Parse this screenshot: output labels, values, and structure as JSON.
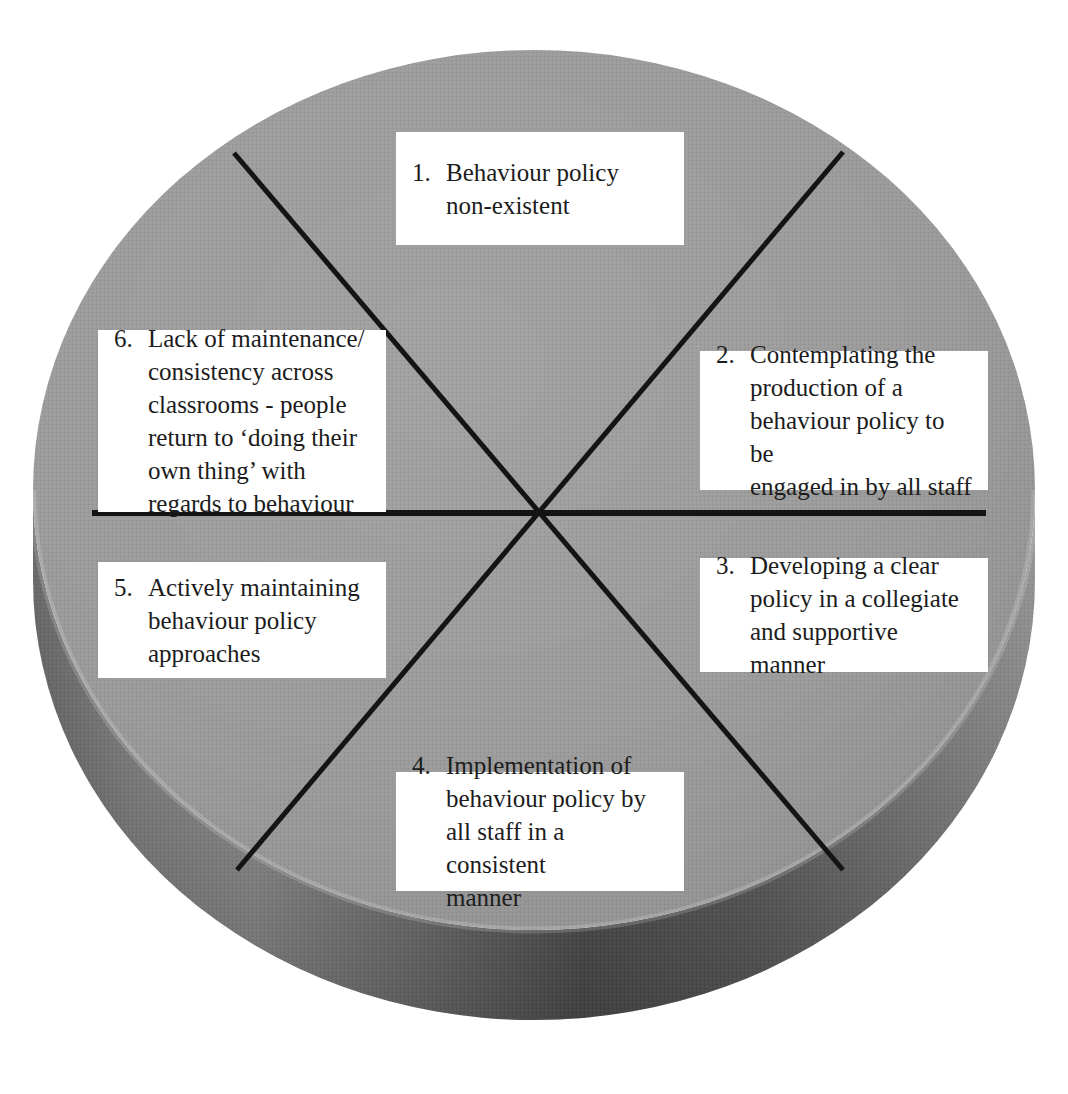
{
  "diagram": {
    "shape": "3d-disc-cylinder",
    "segments": 6,
    "colors": {
      "disc_top": "#9a9a9a",
      "disc_top_highlight": "#a6a6a6",
      "disc_side_light": "#8e8e8e",
      "disc_side_dark": "#4f4f4f",
      "divider_line": "#141414",
      "box_background": "#ffffff",
      "text": "#1c1c1c",
      "page_background": "#ffffff"
    },
    "divider_lines": [
      {
        "name": "horizontal-divider",
        "x1": 92,
        "y1": 513,
        "x2": 986,
        "y2": 513
      },
      {
        "name": "diagonal-divider-nw-se",
        "x1": 234,
        "y1": 153,
        "x2": 843,
        "y2": 870
      },
      {
        "name": "diagonal-divider-ne-sw",
        "x1": 843,
        "y1": 152,
        "x2": 237,
        "y2": 870
      }
    ],
    "center": {
      "x": 534,
      "y": 513
    },
    "items": [
      {
        "number": "1.",
        "text": "Behaviour policy\nnon-existent",
        "position": "top"
      },
      {
        "number": "2.",
        "text": "Contemplating the\nproduction of a\nbehaviour policy to be\nengaged in by all staff",
        "position": "upper-right"
      },
      {
        "number": "3.",
        "text": "Developing a clear\npolicy in a collegiate\nand supportive manner",
        "position": "lower-right"
      },
      {
        "number": "4.",
        "text": "Implementation of\nbehaviour policy by\nall staff in a consistent\nmanner",
        "position": "bottom"
      },
      {
        "number": "5.",
        "text": "Actively maintaining\nbehaviour policy\napproaches",
        "position": "lower-left"
      },
      {
        "number": "6.",
        "text": "Lack of maintenance/\nconsistency across\nclassrooms - people\nreturn to ‘doing their\nown thing’ with\nregards to behaviour",
        "position": "upper-left"
      }
    ]
  }
}
